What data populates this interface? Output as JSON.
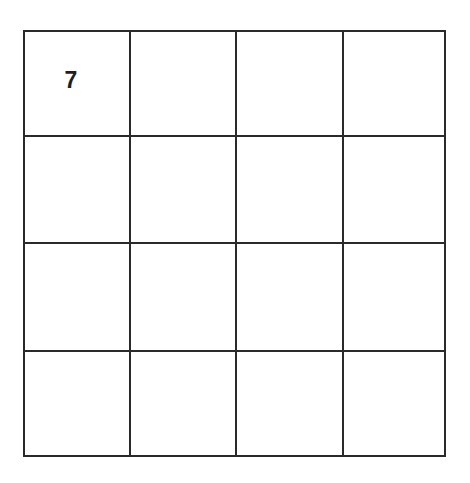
{
  "board": {
    "rows": 4,
    "cols": 4,
    "line_color": "#2a2a2a",
    "cells": [
      [
        "7",
        "",
        "",
        ""
      ],
      [
        "",
        "",
        "",
        ""
      ],
      [
        "",
        "",
        "",
        ""
      ],
      [
        "",
        "",
        "",
        ""
      ]
    ]
  }
}
